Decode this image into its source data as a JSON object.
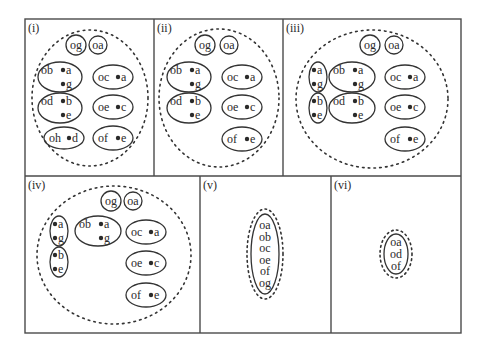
{
  "colors": {
    "background": "#ffffff",
    "frame": "#4a4a4a",
    "stroke": "#333333",
    "dots": "#2a2a2a",
    "text": "#2a2a2a"
  },
  "frame": {
    "x": 25,
    "y": 19,
    "width": 436,
    "height": 314
  },
  "dividers": [
    {
      "x1": 25,
      "y1": 176,
      "x2": 461,
      "y2": 176
    },
    {
      "x1": 154,
      "y1": 19,
      "x2": 154,
      "y2": 176
    },
    {
      "x1": 283,
      "y1": 19,
      "x2": 283,
      "y2": 176
    },
    {
      "x1": 200,
      "y1": 176,
      "x2": 200,
      "y2": 333
    },
    {
      "x1": 331,
      "y1": 176,
      "x2": 331,
      "y2": 333
    }
  ],
  "panels": [
    {
      "id": "i",
      "label": "(i)",
      "label_pos": [
        28,
        32
      ],
      "boundary": {
        "cx": 90,
        "cy": 98,
        "rx": 58,
        "ry": 68
      },
      "nodes": [
        {
          "cx": 76,
          "cy": 45,
          "rx": 10,
          "ry": 10,
          "head": "og",
          "members": []
        },
        {
          "cx": 98,
          "cy": 45,
          "rx": 9,
          "ry": 9,
          "head": "oa",
          "members": []
        },
        {
          "cx": 60,
          "cy": 77,
          "rx": 22,
          "ry": 15,
          "head": "ob",
          "members": [
            "a",
            "g"
          ]
        },
        {
          "cx": 113,
          "cy": 77,
          "rx": 20,
          "ry": 12,
          "head": "oc",
          "members": [
            "a"
          ]
        },
        {
          "cx": 60,
          "cy": 108,
          "rx": 22,
          "ry": 15,
          "head": "od",
          "members": [
            "b",
            "e"
          ]
        },
        {
          "cx": 113,
          "cy": 107,
          "rx": 20,
          "ry": 12,
          "head": "oe",
          "members": [
            "c"
          ]
        },
        {
          "cx": 64,
          "cy": 138,
          "rx": 20,
          "ry": 11,
          "head": "oh",
          "members": [
            "d"
          ]
        },
        {
          "cx": 113,
          "cy": 138,
          "rx": 20,
          "ry": 12,
          "head": "of",
          "members": [
            "e"
          ]
        }
      ]
    },
    {
      "id": "ii",
      "label": "(ii)",
      "label_pos": [
        157,
        32
      ],
      "boundary": {
        "cx": 219,
        "cy": 98,
        "rx": 60,
        "ry": 69
      },
      "nodes": [
        {
          "cx": 205,
          "cy": 45,
          "rx": 10,
          "ry": 10,
          "head": "og",
          "members": []
        },
        {
          "cx": 229,
          "cy": 45,
          "rx": 9,
          "ry": 9,
          "head": "oa",
          "members": []
        },
        {
          "cx": 189,
          "cy": 77,
          "rx": 22,
          "ry": 15,
          "head": "ob",
          "members": [
            "a",
            "g"
          ]
        },
        {
          "cx": 242,
          "cy": 77,
          "rx": 20,
          "ry": 12,
          "head": "oc",
          "members": [
            "a"
          ]
        },
        {
          "cx": 189,
          "cy": 108,
          "rx": 22,
          "ry": 15,
          "head": "od",
          "members": [
            "b",
            "e"
          ]
        },
        {
          "cx": 242,
          "cy": 107,
          "rx": 20,
          "ry": 12,
          "head": "oe",
          "members": [
            "c"
          ]
        },
        {
          "cx": 242,
          "cy": 139,
          "rx": 20,
          "ry": 12,
          "head": "of",
          "members": [
            "e"
          ]
        }
      ]
    },
    {
      "id": "iii",
      "label": "(iii)",
      "label_pos": [
        286,
        32
      ],
      "boundary": {
        "cx": 372,
        "cy": 99,
        "rx": 76,
        "ry": 69
      },
      "nodes": [
        {
          "cx": 370,
          "cy": 45,
          "rx": 10,
          "ry": 10,
          "head": "og",
          "members": []
        },
        {
          "cx": 394,
          "cy": 45,
          "rx": 9,
          "ry": 9,
          "head": "oa",
          "members": []
        },
        {
          "cx": 318,
          "cy": 77,
          "rx": 9,
          "ry": 15,
          "head": "",
          "members": [
            "a",
            "g"
          ]
        },
        {
          "cx": 352,
          "cy": 77,
          "rx": 23,
          "ry": 15,
          "head": "ob",
          "members": [
            "a",
            "g"
          ]
        },
        {
          "cx": 405,
          "cy": 77,
          "rx": 20,
          "ry": 12,
          "head": "oc",
          "members": [
            "a"
          ]
        },
        {
          "cx": 318,
          "cy": 108,
          "rx": 9,
          "ry": 15,
          "head": "",
          "members": [
            "b",
            "e"
          ]
        },
        {
          "cx": 352,
          "cy": 108,
          "rx": 23,
          "ry": 15,
          "head": "od",
          "members": [
            "b",
            "e"
          ]
        },
        {
          "cx": 405,
          "cy": 107,
          "rx": 20,
          "ry": 12,
          "head": "oe",
          "members": [
            "c"
          ]
        },
        {
          "cx": 405,
          "cy": 139,
          "rx": 20,
          "ry": 12,
          "head": "of",
          "members": [
            "e"
          ]
        }
      ]
    },
    {
      "id": "iv",
      "label": "(iv)",
      "label_pos": [
        28,
        189
      ],
      "boundary": {
        "cx": 114,
        "cy": 255,
        "rx": 77,
        "ry": 69
      },
      "nodes": [
        {
          "cx": 111,
          "cy": 201,
          "rx": 10,
          "ry": 10,
          "head": "og",
          "members": []
        },
        {
          "cx": 133,
          "cy": 201,
          "rx": 9,
          "ry": 9,
          "head": "oa",
          "members": []
        },
        {
          "cx": 59,
          "cy": 231,
          "rx": 9,
          "ry": 15,
          "head": "",
          "members": [
            "a",
            "g"
          ]
        },
        {
          "cx": 98,
          "cy": 231,
          "rx": 23,
          "ry": 15,
          "head": "ob",
          "members": [
            "a",
            "g"
          ]
        },
        {
          "cx": 146,
          "cy": 232,
          "rx": 20,
          "ry": 12,
          "head": "oc",
          "members": [
            "a"
          ]
        },
        {
          "cx": 59,
          "cy": 262,
          "rx": 9,
          "ry": 15,
          "head": "",
          "members": [
            "b",
            "e"
          ]
        },
        {
          "cx": 146,
          "cy": 263,
          "rx": 20,
          "ry": 12,
          "head": "oe",
          "members": [
            "c"
          ]
        },
        {
          "cx": 146,
          "cy": 295,
          "rx": 20,
          "ry": 12,
          "head": "of",
          "members": [
            "e"
          ]
        }
      ]
    },
    {
      "id": "v",
      "label": "(v)",
      "label_pos": [
        203,
        189
      ],
      "stack": {
        "cx": 265,
        "cy": 254,
        "solid": {
          "rx": 14,
          "ry": 40
        },
        "dashed": {
          "rx": 18,
          "ry": 45
        },
        "items": [
          "oa",
          "ob",
          "oc",
          "oe",
          "of",
          "og"
        ],
        "line_height": 11.6
      }
    },
    {
      "id": "vi",
      "label": "(vi)",
      "label_pos": [
        334,
        189
      ],
      "stack": {
        "cx": 396,
        "cy": 254,
        "solid": {
          "rx": 12,
          "ry": 20
        },
        "dashed": {
          "rx": 16,
          "ry": 24
        },
        "items": [
          "oa",
          "od",
          "of"
        ],
        "line_height": 11.6
      }
    }
  ]
}
